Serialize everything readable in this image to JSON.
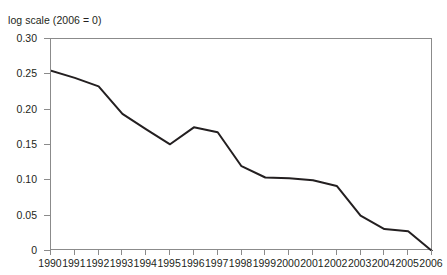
{
  "subtitle": "log scale (2006 = 0)",
  "crop_remnant": "",
  "chart_data": {
    "type": "line",
    "title": "",
    "subtitle": "log scale (2006 = 0)",
    "xlabel": "",
    "ylabel": "",
    "grid": false,
    "legend": "none",
    "xlim": [
      1990,
      2006
    ],
    "ylim": [
      0,
      0.3
    ],
    "yticks": [
      "0.30",
      "0.25",
      "0.20",
      "0.15",
      "0.10",
      "0.05",
      "0"
    ],
    "ytick_values": [
      0.3,
      0.25,
      0.2,
      0.15,
      0.1,
      0.05,
      0
    ],
    "categories": [
      "1990",
      "1991",
      "1992",
      "1993",
      "1994",
      "1995",
      "1996",
      "1997",
      "1998",
      "1999",
      "2000",
      "2001",
      "2002",
      "2003",
      "2004",
      "2005",
      "2006"
    ],
    "x": [
      1990,
      1991,
      1992,
      1993,
      1994,
      1995,
      1996,
      1997,
      1998,
      1999,
      2000,
      2001,
      2002,
      2003,
      2004,
      2005,
      2006
    ],
    "values": [
      0.255,
      0.245,
      0.233,
      0.194,
      0.172,
      0.151,
      0.175,
      0.168,
      0.12,
      0.104,
      0.103,
      0.1,
      0.092,
      0.05,
      0.031,
      0.028,
      0.0
    ],
    "series": [
      {
        "name": "log scale (2006 = 0)",
        "color": "#231f20",
        "values": [
          0.255,
          0.245,
          0.233,
          0.194,
          0.172,
          0.151,
          0.175,
          0.168,
          0.12,
          0.104,
          0.103,
          0.1,
          0.092,
          0.05,
          0.031,
          0.028,
          0.0
        ]
      }
    ]
  },
  "colors": {
    "line": "#231f20",
    "axis": "#8b8b8b",
    "text": "#231f20",
    "background": "#ffffff"
  }
}
